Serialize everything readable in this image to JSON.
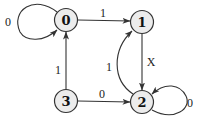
{
  "diagram": {
    "type": "state-transition-graph",
    "nodes": [
      {
        "id": "0",
        "label": "0"
      },
      {
        "id": "1",
        "label": "1"
      },
      {
        "id": "2",
        "label": "2"
      },
      {
        "id": "3",
        "label": "3"
      }
    ],
    "edges": [
      {
        "from": "0",
        "to": "0",
        "label": "0"
      },
      {
        "from": "0",
        "to": "1",
        "label": "1"
      },
      {
        "from": "1",
        "to": "2",
        "label": "X"
      },
      {
        "from": "2",
        "to": "1",
        "label": "1"
      },
      {
        "from": "2",
        "to": "2",
        "label": "0"
      },
      {
        "from": "3",
        "to": "0",
        "label": "1"
      },
      {
        "from": "3",
        "to": "2",
        "label": "0"
      }
    ],
    "colors": {
      "node_fill": "#ececec",
      "stroke": "#333333"
    }
  }
}
